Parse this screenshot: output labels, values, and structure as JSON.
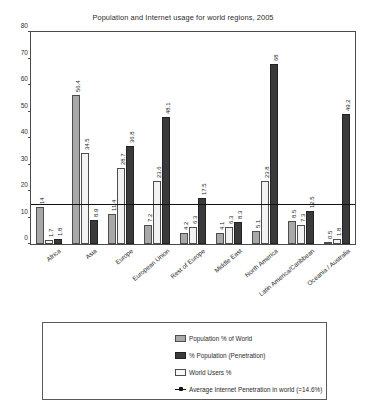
{
  "chart_data": {
    "type": "bar",
    "title": "Population and Internet usage for world regions, 2005",
    "xlabel": "",
    "ylabel": "",
    "ylim": [
      0,
      80
    ],
    "yticks": [
      0,
      10,
      20,
      30,
      40,
      50,
      60,
      70,
      80
    ],
    "grid": false,
    "legend_position": "bottom",
    "categories": [
      "Africa",
      "Asia",
      "Europe",
      "European Union",
      "Rest of Europe",
      "Middle East",
      "North America",
      "Latin America/Caribbean",
      "Oceania / Australia"
    ],
    "series": [
      {
        "name": "Population % of World",
        "color": "#a8a8a8",
        "values": [
          14,
          56.4,
          11.4,
          7.2,
          4.2,
          4.1,
          5.1,
          8.5,
          0.5
        ]
      },
      {
        "name": "World Users %",
        "color": "#f2f2f2",
        "values": [
          1.7,
          34.5,
          28.7,
          23.6,
          6.3,
          6.3,
          23.8,
          7.3,
          1.8
        ]
      },
      {
        "name": "% Population (Penetration)",
        "color": "#3a3a3a",
        "values": [
          1.8,
          8.9,
          36.8,
          48.1,
          17.5,
          8.3,
          68,
          12.5,
          49.2
        ]
      }
    ],
    "reference_line": {
      "label": "Average Internet Penetration in world (=14.6%)",
      "value": 14.6,
      "color": "#111111"
    }
  },
  "legend": {
    "items": [
      "Population % of World",
      "% Population (Penetration)",
      "World Users %",
      "Average Internet Penetration in world (=14.6%)"
    ]
  }
}
